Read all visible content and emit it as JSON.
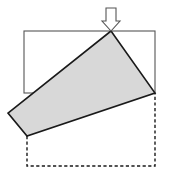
{
  "figure": {
    "width": 169,
    "height": 179,
    "background_color": "#ffffff"
  },
  "colors": {
    "outline_stroke": "#555555",
    "shape_stroke": "#1a1a1a",
    "shape_fill": "#d8d8d8",
    "dashed_stroke": "#1a1a1a",
    "arrow_stroke": "#555555",
    "arrow_fill": "#ffffff"
  },
  "elements": {
    "reference_frame": {
      "name": "reference-rectangle",
      "description": "Thin solid rectangle marking the undeformed bounding frame",
      "x": 24,
      "y": 31,
      "width": 131,
      "height": 62,
      "stroke_width": 1.1,
      "fill": "none"
    },
    "dashed_outline": {
      "name": "original-block-outline",
      "description": "Dashed polyline showing the original untilted block position",
      "points": "27,136 27,166 155,166 155,93",
      "stroke_width": 1.4,
      "dash_pattern": "3.2 2.4"
    },
    "tilted_block": {
      "name": "tilted-block-polygon",
      "description": "Shaded quadrilateral: the block rotated about its lower-left corner",
      "points": "111,31 155,93 27,136 8,113",
      "stroke_width": 1.6
    },
    "load_arrow": {
      "name": "downward-load-arrow",
      "description": "Hollow block arrow indicating the applied downward force",
      "points": "106,8 116,8 116,21 120,21 111,31 102,21 106,21",
      "stroke_width": 1.1
    }
  },
  "labels": {
    "arrow_label": "",
    "block_label": "",
    "frame_label": ""
  }
}
